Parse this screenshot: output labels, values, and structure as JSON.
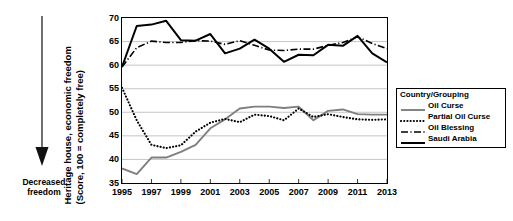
{
  "annotation": {
    "arrow_name": "decreased-freedom-arrow",
    "caption_line1": "Decreased",
    "caption_line2": "freedom"
  },
  "legend": {
    "title": "Country/Grouping",
    "entries": [
      {
        "label": "Oil Curse",
        "style": "solid-gray",
        "color": "#7f7f7f"
      },
      {
        "label": "Partial Oil Curse",
        "style": "dotted",
        "color": "#000000"
      },
      {
        "label": "Oil Blessing",
        "style": "dash-dot",
        "color": "#000000"
      },
      {
        "label": "Saudi Arabia",
        "style": "solid-black",
        "color": "#000000"
      }
    ]
  },
  "chart_data": {
    "type": "line",
    "title": "",
    "xlabel": "",
    "ylabel": "Heritage house, economic freedom (Score, 100 = completely free)",
    "ylabel_line1": "Heritage house, economic freedom",
    "ylabel_line2": "(Score, 100 = completely free)",
    "xlim": [
      1995,
      2013
    ],
    "ylim": [
      35,
      70
    ],
    "yticks": [
      35,
      40,
      45,
      50,
      55,
      60,
      65,
      70
    ],
    "xticks": [
      1995,
      1997,
      1999,
      2001,
      2003,
      2005,
      2007,
      2009,
      2011,
      2013
    ],
    "grid": "horizontal",
    "legend_position": "right",
    "x": [
      1995,
      1996,
      1997,
      1998,
      1999,
      2000,
      2001,
      2002,
      2003,
      2004,
      2005,
      2006,
      2007,
      2008,
      2009,
      2010,
      2011,
      2012,
      2013
    ],
    "series": [
      {
        "name": "Oil Curse",
        "style": "solid-gray",
        "color": "#7f7f7f",
        "values": [
          38.1,
          36.9,
          40.4,
          40.4,
          41.6,
          43.1,
          46.6,
          48.5,
          50.8,
          51.2,
          51.2,
          50.9,
          51.2,
          48.3,
          50.3,
          50.6,
          49.6,
          49.5,
          49.5
        ]
      },
      {
        "name": "Partial Oil Curse",
        "style": "dotted",
        "color": "#000000",
        "values": [
          55.2,
          48.3,
          43.1,
          42.4,
          43.0,
          45.9,
          47.8,
          48.6,
          47.9,
          49.5,
          49.2,
          48.3,
          50.8,
          49.0,
          49.6,
          49.0,
          48.5,
          48.4,
          48.5
        ]
      },
      {
        "name": "Oil Blessing",
        "style": "dash-dot",
        "color": "#000000",
        "values": [
          59.6,
          63.7,
          65.1,
          64.8,
          64.8,
          65.2,
          65.1,
          64.4,
          65.2,
          64.2,
          63.2,
          63.1,
          63.4,
          63.4,
          64.2,
          64.8,
          66.0,
          64.6,
          63.5
        ]
      },
      {
        "name": "Saudi Arabia",
        "style": "solid-black",
        "color": "#000000",
        "values": [
          59.6,
          68.3,
          68.6,
          69.4,
          65.3,
          65.2,
          66.6,
          62.5,
          63.5,
          65.4,
          63.5,
          60.7,
          62.2,
          62.1,
          64.3,
          64.1,
          66.2,
          62.5,
          60.6
        ]
      }
    ]
  }
}
